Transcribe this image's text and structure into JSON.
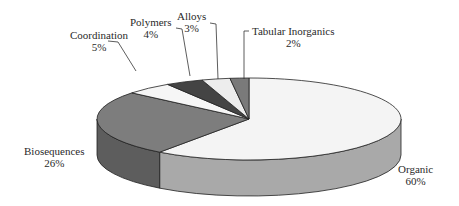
{
  "chart_data": {
    "type": "pie",
    "style": "3d-pie",
    "title": "",
    "start_angle": "12 o'clock",
    "direction": "clockwise",
    "slices": [
      {
        "label": "Organic",
        "value": 60,
        "pct_label": "60%",
        "top_color": "#f4f4f4",
        "side_color": "#a9a9a9"
      },
      {
        "label": "Biosequences",
        "value": 26,
        "pct_label": "26%",
        "top_color": "#7d7d7d",
        "side_color": "#5d5d5d"
      },
      {
        "label": "Coordination",
        "value": 5,
        "pct_label": "5%",
        "top_color": "#f6f6f6",
        "side_color": "#cfcfcf"
      },
      {
        "label": "Polymers",
        "value": 4,
        "pct_label": "4%",
        "top_color": "#444444",
        "side_color": "#333333"
      },
      {
        "label": "Alloys",
        "value": 3,
        "pct_label": "3%",
        "top_color": "#ededed",
        "side_color": "#cccccc"
      },
      {
        "label": "Tabular Inorganics",
        "value": 2,
        "pct_label": "2%",
        "top_color": "#7a7a7a",
        "side_color": "#5a5a5a"
      }
    ],
    "legend": "none (leader-line labels)"
  },
  "labels": {
    "organic": {
      "name": "Organic",
      "pct": "60%"
    },
    "biosequences": {
      "name": "Biosequences",
      "pct": "26%"
    },
    "coordination": {
      "name": "Coordination",
      "pct": "5%"
    },
    "polymers": {
      "name": "Polymers",
      "pct": "4%"
    },
    "alloys": {
      "name": "Alloys",
      "pct": "3%"
    },
    "tabular": {
      "name": "Tabular Inorganics",
      "pct": "2%"
    }
  }
}
